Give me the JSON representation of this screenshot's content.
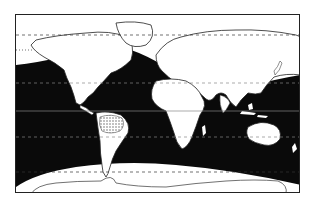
{
  "map": {
    "type": "world distribution map",
    "projection": "equirectangular-like",
    "legend": [],
    "colors": {
      "range_fill": "#0a0a0a",
      "land_fill": "#ffffff",
      "outline": "#222222",
      "stipple_region": "#888888"
    },
    "reference_lines": [
      "Arctic Circle",
      "Tropic of Cancer",
      "Equator",
      "Tropic of Capricorn",
      "Antarctic Circle"
    ],
    "highlighted_regions": [
      {
        "name": "ocean-range",
        "description": "Black-shaded tropical and temperate oceans"
      },
      {
        "name": "amazon-basin",
        "description": "Stippled area in northern South America"
      }
    ]
  }
}
